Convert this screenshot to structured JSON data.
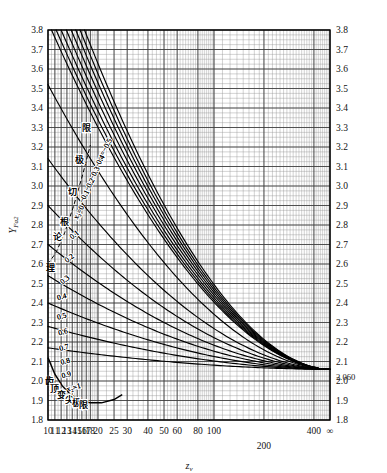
{
  "chart_data": {
    "type": "line",
    "title": "",
    "xlabel": "z_v",
    "ylabel": "Y_Fa2",
    "xscale": "log",
    "xlim": [
      10,
      500
    ],
    "ylim": [
      1.8,
      3.8
    ],
    "grid": true,
    "legend": "inline-curve-labels",
    "x_ticks": [
      {
        "value": 10,
        "label": "10"
      },
      {
        "value": 11,
        "label": "11"
      },
      {
        "value": 12,
        "label": "12"
      },
      {
        "value": 13,
        "label": "13"
      },
      {
        "value": 14,
        "label": "14"
      },
      {
        "value": 15,
        "label": "15"
      },
      {
        "value": 16,
        "label": "16"
      },
      {
        "value": 17,
        "label": "17"
      },
      {
        "value": 18,
        "label": "18"
      },
      {
        "value": 20,
        "label": "20"
      },
      {
        "value": 25,
        "label": "25"
      },
      {
        "value": 30,
        "label": "30"
      },
      {
        "value": 40,
        "label": "40"
      },
      {
        "value": 50,
        "label": "50"
      },
      {
        "value": 60,
        "label": "60"
      },
      {
        "value": 80,
        "label": "80"
      },
      {
        "value": 100,
        "label": "100"
      },
      {
        "value": 200,
        "label": "200"
      },
      {
        "value": 400,
        "label": "400"
      },
      {
        "value": 500,
        "label": "∞"
      }
    ],
    "y_ticks": [
      {
        "value": 1.8,
        "label": "1.8"
      },
      {
        "value": 1.9,
        "label": "1.9"
      },
      {
        "value": 2.0,
        "label": "2.0"
      },
      {
        "value": 2.1,
        "label": "2.1"
      },
      {
        "value": 2.2,
        "label": "2.2"
      },
      {
        "value": 2.3,
        "label": "2.3"
      },
      {
        "value": 2.4,
        "label": "2.4"
      },
      {
        "value": 2.5,
        "label": "2.5"
      },
      {
        "value": 2.6,
        "label": "2.6"
      },
      {
        "value": 2.7,
        "label": "2.7"
      },
      {
        "value": 2.8,
        "label": "2.8"
      },
      {
        "value": 2.9,
        "label": "2.9"
      },
      {
        "value": 3.0,
        "label": "3.0"
      },
      {
        "value": 3.1,
        "label": "3.1"
      },
      {
        "value": 3.2,
        "label": "3.2"
      },
      {
        "value": 3.3,
        "label": "3.3"
      },
      {
        "value": 3.4,
        "label": "3.4"
      },
      {
        "value": 3.5,
        "label": "3.5"
      },
      {
        "value": 3.6,
        "label": "3.6"
      },
      {
        "value": 3.7,
        "label": "3.7"
      },
      {
        "value": 3.8,
        "label": "3.8"
      }
    ],
    "convergence": {
      "x": 500,
      "y": 2.06,
      "label": "2.060"
    },
    "series": [
      {
        "name": "x2 = -0.5",
        "label": "x₂=−0.5",
        "start_x": 16.6,
        "start_y": 3.8,
        "label_x": 22.5,
        "label_y": 3.18
      },
      {
        "name": "x2 = -0.4",
        "label": "−0.4",
        "start_x": 15.6,
        "start_y": 3.8,
        "label_x": 21.0,
        "label_y": 3.12
      },
      {
        "name": "x2 = -0.3",
        "label": "−0.3",
        "start_x": 14.7,
        "start_y": 3.8,
        "label_x": 19.6,
        "label_y": 3.06
      },
      {
        "name": "x2 = -0.2",
        "label": "−0.2",
        "start_x": 13.8,
        "start_y": 3.8,
        "label_x": 18.3,
        "label_y": 3.0
      },
      {
        "name": "x2 = -0.1",
        "label": "−0.1",
        "start_x": 12.9,
        "start_y": 3.8,
        "label_x": 17.0,
        "label_y": 2.94
      },
      {
        "name": "x2 = 0",
        "label": "x₂=0",
        "start_x": 12.0,
        "start_y": 3.8,
        "label_x": 15.8,
        "label_y": 2.86
      },
      {
        "name": "x2 = 0.1",
        "label": "0.1",
        "start_x": 11.2,
        "start_y": 3.8,
        "label_x": 14.7,
        "label_y": 2.74
      },
      {
        "name": "x2 = 0.2",
        "label": "0.2",
        "start_x": 10.5,
        "start_y": 3.8,
        "label_x": 13.7,
        "label_y": 2.62
      },
      {
        "name": "x2 = 0.3",
        "label": "0.3",
        "start_x": 10.0,
        "start_y": 3.52,
        "label_x": 12.9,
        "label_y": 2.51
      },
      {
        "name": "x2 = 0.4",
        "label": "0.4",
        "start_x": 10.0,
        "start_y": 3.14,
        "label_x": 12.2,
        "label_y": 2.42
      },
      {
        "name": "x2 = 0.5",
        "label": "0.5",
        "start_x": 10.0,
        "start_y": 2.9,
        "label_x": 12.2,
        "label_y": 2.32
      },
      {
        "name": "x2 = 0.6",
        "label": "0.6",
        "start_x": 10.0,
        "start_y": 2.7,
        "label_x": 12.4,
        "label_y": 2.24
      },
      {
        "name": "x2 = 0.7",
        "label": "0.7",
        "start_x": 10.0,
        "start_y": 2.54,
        "label_x": 12.6,
        "label_y": 2.16
      },
      {
        "name": "x2 = 0.8",
        "label": "0.8",
        "start_x": 10.0,
        "start_y": 2.4,
        "label_x": 12.8,
        "label_y": 2.09
      },
      {
        "name": "x2 = 0.9",
        "label": "0.9",
        "start_x": 10.0,
        "start_y": 2.28,
        "label_x": 13.0,
        "label_y": 2.02
      },
      {
        "name": "x2 = 1",
        "label": "x₂=1",
        "start_x": 10.0,
        "start_y": 2.17,
        "label_x": 14.4,
        "label_y": 1.955
      }
    ],
    "annotations": [
      {
        "name": "theoretical-undercut-limit",
        "text": "理论切根极限",
        "style": "dashed-diagonal",
        "chars": [
          "理",
          "论",
          "根",
          "切",
          "极",
          "限"
        ]
      },
      {
        "name": "tooth-tip-pointing-limit",
        "text": "齿顶变尖极限",
        "style": "solid-curve",
        "chars": [
          "齿",
          "顶",
          "变",
          "尖",
          "极",
          "限"
        ]
      }
    ]
  },
  "axes": {
    "y_label": "Y",
    "y_label_sub": "Fa2",
    "x_label": "z",
    "x_label_sub": "v"
  },
  "colors": {
    "background": "#ffffff",
    "grid_major": "#3a3a3a",
    "grid_minor": "#8f8f8f",
    "curve": "#000000",
    "axis": "#000000"
  }
}
